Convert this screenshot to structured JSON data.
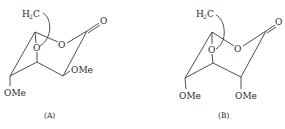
{
  "figure": {
    "structures": [
      {
        "id": "A",
        "caption": "(A)",
        "labels": {
          "bridge_h": "H",
          "bridge_sub": "2",
          "bridge_c": "C",
          "carbonyl_o": "O",
          "ring_o": "O",
          "lactone_o": "O",
          "ome_right": "OMe",
          "ome_bottom": "OMe"
        }
      },
      {
        "id": "B",
        "caption": "(B)",
        "labels": {
          "bridge_h": "H",
          "bridge_sub": "2",
          "bridge_c": "C",
          "carbonyl_o": "O",
          "ring_o": "O",
          "lactone_o": "O",
          "ome_left": "OMe",
          "ome_right": "OMe"
        }
      }
    ],
    "colors": {
      "line": "#3a3a3a",
      "text": "#2a2a2a",
      "background": "#ffffff"
    }
  }
}
